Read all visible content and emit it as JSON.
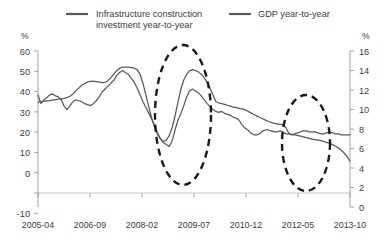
{
  "legend": {
    "position": "top",
    "entries": [
      {
        "label_line1": "Infrastructure construction",
        "label_line2": "investment year-to-year",
        "color": "#595959",
        "swatch_name": "legend-swatch-infrastructure"
      },
      {
        "label_line1": "GDP  year-to-year",
        "label_line2": "",
        "color": "#595959",
        "swatch_name": "legend-swatch-gdp"
      }
    ]
  },
  "axes": {
    "left_unit": "%",
    "right_unit": "%",
    "left_ticks": [
      "60",
      "50",
      "40",
      "30",
      "20",
      "10",
      "0",
      "-10"
    ],
    "right_ticks": [
      "16",
      "14",
      "12",
      "10",
      "8",
      "6",
      "4",
      "2",
      "0"
    ],
    "x_ticks": [
      "2005-04",
      "2006-09",
      "2008-02",
      "2009-07",
      "2010-12",
      "2012-05",
      "2013-10"
    ]
  },
  "annotations": [
    {
      "name": "highlight-ellipse-2009",
      "cx": 183,
      "cy": 115,
      "rx": 28,
      "ry": 70
    },
    {
      "name": "highlight-ellipse-2013",
      "cx": 306,
      "cy": 143,
      "rx": 24,
      "ry": 48
    }
  ],
  "chart_data": {
    "type": "line",
    "title": "",
    "subtitle": "",
    "xlabel": "",
    "ylabel": "%",
    "y2label": "%",
    "grid": false,
    "legend_position": "top",
    "ylim": [
      -10,
      60
    ],
    "y2lim": [
      0,
      16
    ],
    "x_tick_labels": [
      "2005-04",
      "2006-09",
      "2008-02",
      "2009-07",
      "2010-12",
      "2012-05",
      "2013-10"
    ],
    "x_tick_index": [
      0,
      17,
      34,
      51,
      68,
      85,
      102
    ],
    "x_start": "2005-04",
    "x_end": "2014-03",
    "series": [
      {
        "name": "Infrastructure construction investment year-to-year",
        "axis": "left",
        "unit": "%",
        "values": [
          38.0,
          38.2,
          38.3,
          38.5,
          38.6,
          38.8,
          39.0,
          39.2,
          39.4,
          39.6,
          40.0,
          40.5,
          41.5,
          42.8,
          44.0,
          45.2,
          46.0,
          46.6,
          46.9,
          47.0,
          46.8,
          46.6,
          46.4,
          46.5,
          47.2,
          48.5,
          50.0,
          51.5,
          52.6,
          53.0,
          53.1,
          53.0,
          52.8,
          52.6,
          52.0,
          50.0,
          46.0,
          41.0,
          36.0,
          31.0,
          27.0,
          24.0,
          22.0,
          21.0,
          21.5,
          23.5,
          27.0,
          32.0,
          38.0,
          43.5,
          47.5,
          50.0,
          51.5,
          52.0,
          51.6,
          51.0,
          50.0,
          48.5,
          46.5,
          44.0,
          41.0,
          38.2,
          37.6,
          37.3,
          37.0,
          36.6,
          36.2,
          35.8,
          35.6,
          35.3,
          35.0,
          34.6,
          34.0,
          33.3,
          32.6,
          32.0,
          31.4,
          30.8,
          30.2,
          29.6,
          29.2,
          28.8,
          28.6,
          28.4,
          28.2,
          27.0,
          24.5,
          24.0,
          23.8,
          23.6,
          23.3,
          23.0,
          22.6,
          22.3,
          22.0,
          21.8,
          21.6,
          21.3,
          21.0,
          20.6,
          20.2,
          19.6,
          19.0,
          18.2,
          17.2,
          16.0,
          14.5,
          12.5
        ]
      },
      {
        "name": "GDP year-to-year",
        "axis": "right",
        "unit": "%",
        "values": [
          11.5,
          10.6,
          11.0,
          11.2,
          11.5,
          11.6,
          11.4,
          11.3,
          11.0,
          10.3,
          10.0,
          10.4,
          10.8,
          11.0,
          10.9,
          10.8,
          10.6,
          10.5,
          10.4,
          10.6,
          10.9,
          11.3,
          11.8,
          12.1,
          12.4,
          12.7,
          13.0,
          13.5,
          13.8,
          14.0,
          13.8,
          13.6,
          13.2,
          12.8,
          12.2,
          11.5,
          10.8,
          10.2,
          9.6,
          9.0,
          8.4,
          7.6,
          7.0,
          6.6,
          6.4,
          6.2,
          6.8,
          7.9,
          8.9,
          9.6,
          10.4,
          11.3,
          11.9,
          12.1,
          11.9,
          11.7,
          11.4,
          11.0,
          10.6,
          10.3,
          10.0,
          9.8,
          9.7,
          9.8,
          9.6,
          9.5,
          9.4,
          9.2,
          9.1,
          8.9,
          8.4,
          8.1,
          7.9,
          7.6,
          7.4,
          7.4,
          7.5,
          7.8,
          7.9,
          7.9,
          7.8,
          7.7,
          7.7,
          7.8,
          7.7,
          7.5,
          7.5,
          7.4,
          7.5,
          7.6,
          7.7,
          7.8,
          7.8,
          7.7,
          7.7,
          7.7,
          7.6,
          7.5,
          7.5,
          7.6,
          7.7,
          7.6,
          7.5,
          7.5,
          7.4,
          7.4,
          7.4,
          7.4
        ]
      }
    ]
  }
}
